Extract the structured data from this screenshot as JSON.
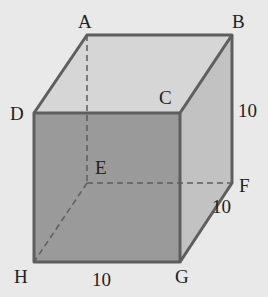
{
  "diagram": {
    "type": "cube",
    "vertices": {
      "A": {
        "label": "A",
        "x": 87,
        "y": 35
      },
      "B": {
        "label": "B",
        "x": 232,
        "y": 35
      },
      "C": {
        "label": "C",
        "x": 180,
        "y": 113
      },
      "D": {
        "label": "D",
        "x": 34,
        "y": 113
      },
      "E": {
        "label": "E",
        "x": 87,
        "y": 183
      },
      "F": {
        "label": "F",
        "x": 232,
        "y": 183
      },
      "G": {
        "label": "G",
        "x": 180,
        "y": 262
      },
      "H": {
        "label": "H",
        "x": 34,
        "y": 262
      }
    },
    "dimensions": {
      "BF": "10",
      "GF": "10",
      "HG": "10"
    },
    "colors": {
      "background": "#e9e9e9",
      "front_face": "#9a9a9a",
      "top_face": "#d6d6d6",
      "side_face": "#c2c2c2",
      "edge": "#5e5e5e"
    }
  }
}
